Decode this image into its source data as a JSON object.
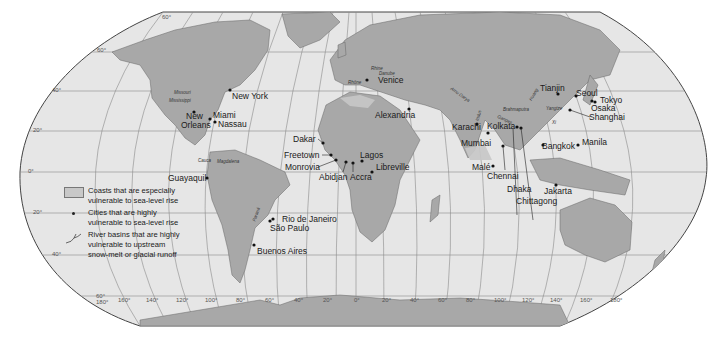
{
  "map": {
    "colors": {
      "ocean": "#e6e6e6",
      "land": "#a8a8a8",
      "coast_vulnerable": "#c8c8c8",
      "grid": "#8a8a8a",
      "border": "#444444"
    },
    "legend": {
      "items": [
        {
          "symbol": "swatch",
          "line1": "Coasts that are especially",
          "line2": "vulnerable to sea-level rise"
        },
        {
          "symbol": "dot",
          "line1": "Cities that are highly",
          "line2": "vulnerable to sea-level rise"
        },
        {
          "symbol": "river-icon",
          "line1": "River basins that are highly",
          "line2": "vulnerable to upstream",
          "line3": "snow-melt or glacial runoff"
        }
      ]
    },
    "cities": {
      "new_york": "New York",
      "new_orleans_1": "New",
      "new_orleans_2": "Orleans",
      "miami": "Miami",
      "nassau": "Nassau",
      "guayaquil": "Guayaquil",
      "rio": "Rio de Janeiro",
      "sao_paulo": "São Paulo",
      "buenos_aires": "Buenos Aires",
      "dakar": "Dakar",
      "freetown": "Freetown",
      "monrovia": "Monrovia",
      "abidjan": "Abidjan",
      "accra": "Accra",
      "lagos": "Lagos",
      "libreville": "Libreville",
      "venice": "Venice",
      "alexandria": "Alexandria",
      "karachi": "Karachi",
      "mumbai": "Mumbai",
      "male": "Malé",
      "chennai": "Chennai",
      "kolkata": "Kolkata",
      "dhaka": "Dhaka",
      "chittagong": "Chittagong",
      "bangkok": "Bangkok",
      "jakarta": "Jakarta",
      "manila": "Manila",
      "tianjin": "Tianjin",
      "seoul": "Seoul",
      "tokyo": "Tokyo",
      "osaka": "Osaka",
      "shanghai": "Shanghai"
    },
    "rivers": {
      "missouri": "Missouri",
      "mississippi": "Mississippi",
      "cauca": "Cauca",
      "magdalena": "Magdalena",
      "parana": "Paraná",
      "rhine": "Rhine",
      "rhone": "Rhône",
      "danube": "Danube",
      "amu_darya": "Amu Darya",
      "indus": "Indus",
      "ganges": "Ganges",
      "brahmaputra": "Brahmaputra",
      "yangtze": "Yangtze",
      "huang": "Huang",
      "xi": "Xi"
    },
    "lat_ticks": {
      "n60": "60°",
      "n40": "40°",
      "n20": "20°",
      "eq": "0°",
      "s20": "20°",
      "s40": "40°",
      "s60": "60°"
    },
    "lon_ticks": [
      "180°",
      "160°",
      "140°",
      "120°",
      "100°",
      "80°",
      "60°",
      "40°",
      "20°",
      "0°",
      "20°",
      "40°",
      "60°",
      "80°",
      "100°",
      "120°",
      "140°",
      "160°",
      "180°"
    ]
  }
}
